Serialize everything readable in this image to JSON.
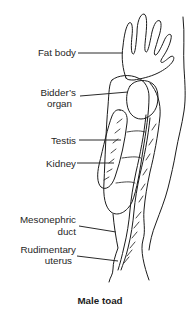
{
  "figure": {
    "type": "anatomical-line-diagram",
    "caption": "Male toad",
    "labels": {
      "fat_body": {
        "text": "Fat body"
      },
      "bidders_organ": {
        "line1": "Bidder’s",
        "line2": "organ"
      },
      "testis": {
        "text": "Testis"
      },
      "kidney": {
        "text": "Kidney"
      },
      "mesonephric_duct": {
        "line1": "Mesonephric",
        "line2": "duct"
      },
      "rudimentary_uterus": {
        "line1": "Rudimentary",
        "line2": "uterus"
      }
    },
    "colors": {
      "line": "#1c1c1c",
      "text": "#262626",
      "background": "#ffffff"
    }
  }
}
